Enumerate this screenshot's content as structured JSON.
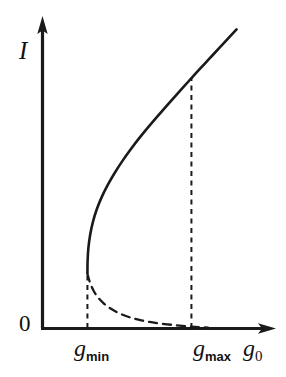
{
  "figure": {
    "background_color": "#ffffff",
    "ink_color": "#1a1a1a",
    "width": 286,
    "height": 377
  },
  "axes": {
    "y_axis": {
      "label": "I",
      "name": "intensity-axis",
      "origin_label": "0",
      "arrow": "up"
    },
    "x_axis": {
      "label": "g",
      "label_subscript": "0",
      "name": "gain-axis",
      "arrow": "right"
    }
  },
  "ticks": [
    {
      "id": "g-min",
      "base": "g",
      "sub": "min"
    },
    {
      "id": "g-max",
      "base": "g",
      "sub": "max"
    }
  ],
  "chart_data": {
    "type": "line",
    "title": "",
    "xlabel": "g0",
    "ylabel": "I",
    "grid": false,
    "legend": null,
    "xlim": [
      0,
      1
    ],
    "ylim": [
      0,
      1
    ],
    "annotations": [
      {
        "text": "g_min",
        "x": 0.228,
        "y": 0.0,
        "note": "lower fold / turning point abscissa"
      },
      {
        "text": "g_max",
        "x": 0.756,
        "y": 0.0,
        "note": "upper bistability limit abscissa"
      },
      {
        "text": "0",
        "x": 0.0,
        "y": 0.0,
        "note": "origin"
      }
    ],
    "series": [
      {
        "name": "stable-upper-branch",
        "style": "solid",
        "linewidth": 2.2,
        "color": "#1a1a1a",
        "points": [
          [
            0.228,
            0.1806
          ],
          [
            0.229,
            0.221
          ],
          [
            0.233,
            0.263
          ],
          [
            0.242,
            0.306
          ],
          [
            0.256,
            0.348
          ],
          [
            0.276,
            0.39
          ],
          [
            0.301,
            0.43
          ],
          [
            0.332,
            0.47
          ],
          [
            0.367,
            0.509
          ],
          [
            0.406,
            0.548
          ],
          [
            0.448,
            0.586
          ],
          [
            0.493,
            0.624
          ],
          [
            0.54,
            0.661
          ],
          [
            0.589,
            0.698
          ],
          [
            0.639,
            0.735
          ],
          [
            0.69,
            0.772
          ],
          [
            0.742,
            0.809
          ],
          [
            0.756,
            0.819
          ],
          [
            0.794,
            0.846
          ],
          [
            0.847,
            0.883
          ],
          [
            0.9,
            0.92
          ],
          [
            0.952,
            0.956
          ],
          [
            0.985,
            0.979
          ]
        ]
      },
      {
        "name": "unstable-lower-branch",
        "style": "dashed",
        "linewidth": 2.2,
        "dash": "8,6",
        "color": "#1a1a1a",
        "points": [
          [
            0.228,
            0.178
          ],
          [
            0.24,
            0.151
          ],
          [
            0.258,
            0.124
          ],
          [
            0.282,
            0.1
          ],
          [
            0.312,
            0.08
          ],
          [
            0.348,
            0.063
          ],
          [
            0.39,
            0.048
          ],
          [
            0.438,
            0.036
          ],
          [
            0.492,
            0.0265
          ],
          [
            0.552,
            0.019
          ],
          [
            0.618,
            0.013
          ],
          [
            0.68,
            0.009
          ],
          [
            0.74,
            0.0055
          ],
          [
            0.79,
            0.003
          ],
          [
            0.84,
            0.0015
          ]
        ]
      }
    ],
    "guides": [
      {
        "name": "g-min-dropline",
        "style": "dashed",
        "orientation": "vertical",
        "x": 0.228,
        "y_from": 0.0,
        "y_to": 0.1806
      },
      {
        "name": "g-max-dropline",
        "style": "dashed",
        "orientation": "vertical",
        "x": 0.756,
        "y_from": 0.0,
        "y_to": 0.819
      }
    ]
  }
}
